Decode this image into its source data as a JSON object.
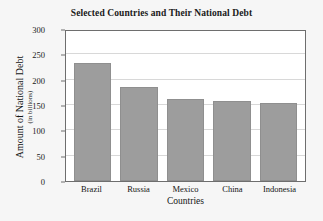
{
  "chart_data": {
    "type": "bar",
    "title": "Selected Countries and Their National Debt",
    "xlabel": "Countries",
    "ylabel": "Amount of National Debt",
    "ylabel_sub": "(in billions)",
    "categories": [
      "Brazil",
      "Russia",
      "Mexico",
      "China",
      "Indonesia"
    ],
    "values": [
      232,
      185,
      162,
      157,
      153
    ],
    "ylim": [
      0,
      300
    ],
    "yticks": [
      0,
      50,
      100,
      150,
      200,
      250,
      300
    ],
    "ytick_labels": [
      "0",
      "50",
      "100",
      "150",
      "200",
      "250",
      "300"
    ],
    "grid": true,
    "legend": "none",
    "series": [
      {
        "name": "National Debt",
        "values": [
          232,
          185,
          162,
          157,
          153
        ]
      }
    ]
  },
  "style": {
    "bar_color": "#9d9d9d",
    "bar_edge_color": "#8f8f8f",
    "plot_background": "#ffffff",
    "figure_background": "#f6f6f6",
    "gridline_color": "#d8d8d8",
    "axis_color": "#6e6e6e",
    "text_color": "#141414"
  }
}
